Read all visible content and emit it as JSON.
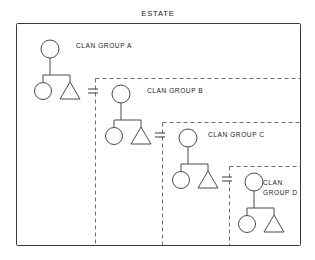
{
  "diagram": {
    "title": "ESTATE",
    "type": "kinship-genealogy-chart",
    "canvas": {
      "width": 315,
      "height": 260,
      "background": "#ffffff"
    },
    "colors": {
      "text": "#1b1b1b",
      "estate_border": "#3a3a3a",
      "clan_border": "#6e6e6e",
      "symbol_stroke": "#4a4a4a",
      "symbol_fill": "#ffffff"
    },
    "estate_boundary": {
      "label": "ESTATE",
      "style": "solid",
      "x": 16,
      "y": 23,
      "width": 284,
      "height": 222
    },
    "title_position": {
      "x": 158,
      "y": 16
    },
    "clans": [
      {
        "id": "A",
        "label": "CLAN GROUP A",
        "label_lines": [
          "CLAN GROUP A"
        ],
        "label_x": 76,
        "label_y": 48,
        "mother": {
          "shape": "circle",
          "cx": 50,
          "cy": 49,
          "r": 9
        },
        "stem": {
          "x": 50,
          "y1": 58,
          "y2": 75
        },
        "sibling_bar": {
          "y": 75,
          "x1": 43,
          "x2": 70
        },
        "daughter": {
          "shape": "circle",
          "cx": 43,
          "cy": 91,
          "r": 8.5
        },
        "son": {
          "shape": "triangle",
          "cx": 70,
          "apex_y": 82,
          "base_y": 99,
          "half_width": 10
        },
        "boundary": null
      },
      {
        "id": "B",
        "label": "CLAN GROUP B",
        "label_lines": [
          "CLAN GROUP B"
        ],
        "label_x": 147,
        "label_y": 93,
        "mother": {
          "shape": "circle",
          "cx": 121,
          "cy": 94,
          "r": 9
        },
        "stem": {
          "x": 121,
          "y1": 103,
          "y2": 120
        },
        "sibling_bar": {
          "y": 120,
          "x1": 114,
          "x2": 141
        },
        "daughter": {
          "shape": "circle",
          "cx": 114,
          "cy": 136,
          "r": 8.5
        },
        "son": {
          "shape": "triangle",
          "cx": 141,
          "apex_y": 127,
          "base_y": 144,
          "half_width": 10
        },
        "boundary": {
          "style": "dashed",
          "x": 95,
          "y": 78,
          "right": 300,
          "bottom": 245
        }
      },
      {
        "id": "C",
        "label": "CLAN GROUP C",
        "label_lines": [
          "CLAN GROUP C"
        ],
        "label_x": 208,
        "label_y": 137,
        "mother": {
          "shape": "circle",
          "cx": 188,
          "cy": 138,
          "r": 9
        },
        "stem": {
          "x": 188,
          "y1": 147,
          "y2": 164
        },
        "sibling_bar": {
          "y": 164,
          "x1": 181,
          "x2": 208
        },
        "daughter": {
          "shape": "circle",
          "cx": 181,
          "cy": 180,
          "r": 8.5
        },
        "son": {
          "shape": "triangle",
          "cx": 208,
          "apex_y": 171,
          "base_y": 188,
          "half_width": 10
        },
        "boundary": {
          "style": "dashed",
          "x": 162,
          "y": 122,
          "right": 300,
          "bottom": 245
        }
      },
      {
        "id": "D",
        "label": "CLAN GROUP D",
        "label_lines": [
          "CLAN",
          "GROUP D"
        ],
        "label_x": 263,
        "label_y": 185,
        "mother": {
          "shape": "circle",
          "cx": 254,
          "cy": 182,
          "r": 9
        },
        "stem": {
          "x": 254,
          "y1": 191,
          "y2": 208
        },
        "sibling_bar": {
          "y": 208,
          "x1": 247,
          "x2": 274
        },
        "daughter": {
          "shape": "circle",
          "cx": 247,
          "cy": 224,
          "r": 8.5
        },
        "son": {
          "shape": "triangle",
          "cx": 274,
          "apex_y": 215,
          "base_y": 232,
          "half_width": 10
        },
        "boundary": {
          "style": "dashed",
          "x": 229,
          "y": 166,
          "right": 300,
          "bottom": 245
        }
      }
    ],
    "marriages": [
      {
        "id": "A-B",
        "symbol": "=",
        "x": 93,
        "y": 91,
        "half_width": 5,
        "gap": 4,
        "between": [
          "A.son",
          "B.mother"
        ]
      },
      {
        "id": "B-C",
        "symbol": "=",
        "x": 160,
        "y": 135,
        "half_width": 5,
        "gap": 4,
        "between": [
          "B.son",
          "C.mother"
        ]
      },
      {
        "id": "C-D",
        "symbol": "=",
        "x": 227,
        "y": 179,
        "half_width": 5,
        "gap": 4,
        "between": [
          "C.son",
          "D.mother"
        ]
      }
    ],
    "legend_notes": {
      "circle_meaning": "female",
      "triangle_meaning": "male",
      "equals_meaning": "marriage"
    }
  }
}
